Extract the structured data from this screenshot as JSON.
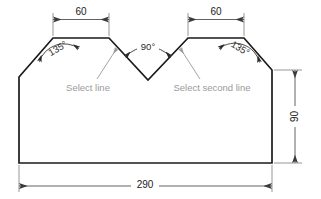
{
  "drawing": {
    "title": "Chamfered plate with V-notch — dimensioned technical drawing",
    "units_note": "",
    "colors": {
      "outline": "#1a1a1a",
      "dimension": "#555555",
      "extension": "#777777",
      "annotation_gray": "#9a9a9a",
      "angle_text": "#2b2b2b",
      "background": "#ffffff"
    }
  },
  "dimensions": {
    "top_left_width": "60",
    "top_right_width": "60",
    "overall_width": "290",
    "right_height": "90"
  },
  "angles": {
    "left_chamfer": "135°",
    "right_chamfer": "135°",
    "notch": "90°"
  },
  "annotations": {
    "first_label": "Select line",
    "second_label": "Select second line"
  },
  "geometry": {
    "vertices": [
      [
        19,
        77
      ],
      [
        53,
        38
      ],
      [
        109,
        38
      ],
      [
        148,
        80
      ],
      [
        188,
        38
      ],
      [
        244,
        38
      ],
      [
        272,
        70
      ],
      [
        272,
        163
      ],
      [
        19,
        163
      ]
    ]
  }
}
